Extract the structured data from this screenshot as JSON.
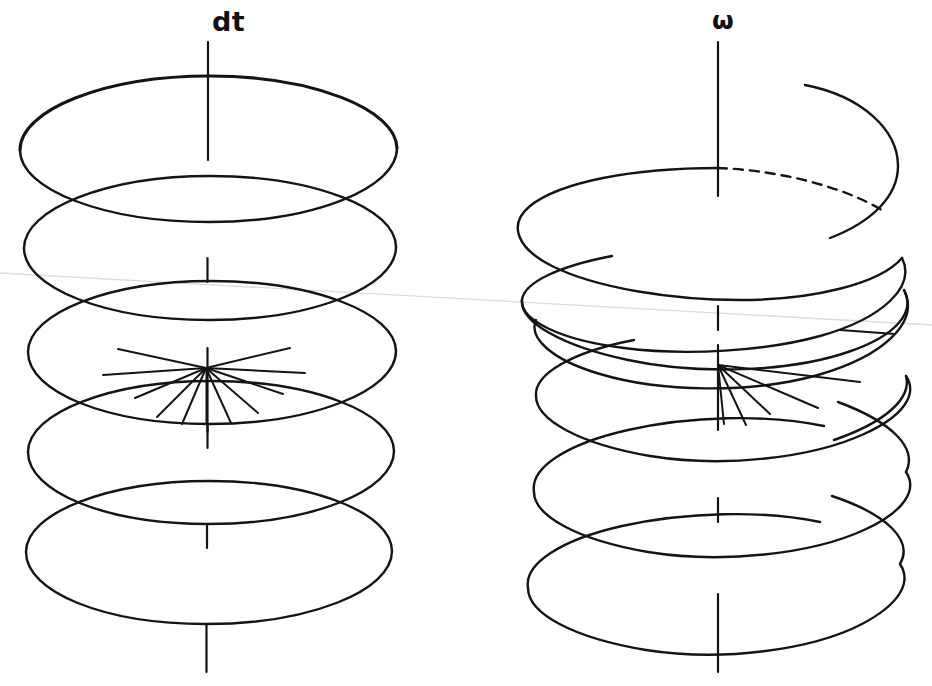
{
  "figure": {
    "kind": "hand-drawn-diagram",
    "background_color": "#ffffff",
    "ink_color": "#141414",
    "fold_line_color": "#dcdcdc",
    "width": 932,
    "height": 686,
    "labels": {
      "left": "dt",
      "right": "ω"
    },
    "left_stack": {
      "name": "dt-disc-stack",
      "description": "five separate stacked flat discs drawn as closed ellipses about a vertical axis",
      "axis_x": 208,
      "axis_top": 42,
      "axis_bottom": 672,
      "ring_count": 5,
      "ring_rx": 190,
      "ring_ry": 72,
      "ring_centers_y": [
        148,
        246,
        352,
        452,
        552
      ],
      "spoke_ring_index": 2,
      "spoke_center": [
        208,
        368
      ],
      "spoke_count": 11,
      "closed_rings": true,
      "dashed_back_arc": false
    },
    "right_stack": {
      "name": "omega-helix",
      "description": "continuous helix of four and a half turns about a vertical axis with a dashed hidden back arc on the first turn",
      "axis_x": 718,
      "axis_top": 42,
      "axis_bottom": 672,
      "turn_count": 4.5,
      "ring_rx": 190,
      "ring_ry": 72,
      "ring_centers_y": [
        200,
        300,
        396,
        492,
        588
      ],
      "helix_start": [
        805,
        85
      ],
      "spoke_center": [
        718,
        365
      ],
      "spoke_count": 6,
      "spoke_side": "right",
      "closed_rings": false,
      "dashed_back_arc": true,
      "dashed_arc_from": [
        718,
        168
      ],
      "dashed_arc_to": [
        885,
        212
      ]
    },
    "fold_line": {
      "name": "scan-fold-line",
      "from": [
        0,
        273
      ],
      "to": [
        932,
        325
      ]
    }
  }
}
